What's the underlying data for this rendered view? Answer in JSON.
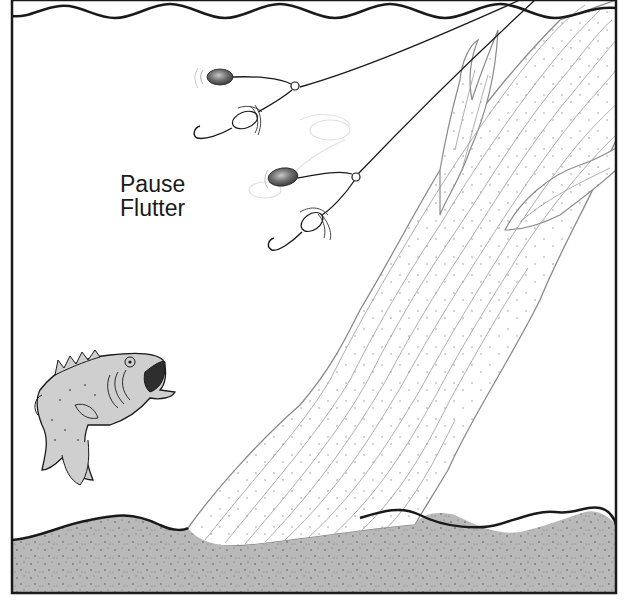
{
  "caption": {
    "line1": "Pause",
    "line2": "Flutter"
  },
  "elements": {
    "water_surface": "wavy-surface-line",
    "lures": [
      {
        "name": "spinnerbait-upper",
        "state": "fluttering"
      },
      {
        "name": "spinnerbait-lower",
        "state": "fluttering"
      }
    ],
    "fish": "largemouth-bass",
    "structure": "submerged-tree-trunk",
    "bottom": "stippled-lake-bottom"
  },
  "colors": {
    "outline": "#1a1a1a",
    "ground": "#b9b9b9",
    "fish_body": "#cfcfcf",
    "blade": "#6f6f6f",
    "wood_line": "#8a8a8a"
  }
}
